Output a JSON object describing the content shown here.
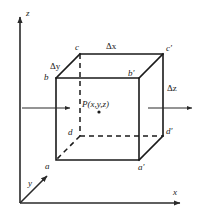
{
  "figure": {
    "background_color": "#ffffff",
    "line_color": "#1a1a1a",
    "axes": [
      {
        "name": "z-axis",
        "label": "z",
        "direction": "up"
      },
      {
        "name": "x-axis",
        "label": "x",
        "direction": "right"
      },
      {
        "name": "y-axis",
        "label": "y",
        "direction": "down-left"
      }
    ],
    "vertices": [
      {
        "name": "vertex-a",
        "label": "a"
      },
      {
        "name": "vertex-b",
        "label": "b"
      },
      {
        "name": "vertex-c",
        "label": "c"
      },
      {
        "name": "vertex-d",
        "label": "d"
      },
      {
        "name": "vertex-a-prime",
        "label": "a′"
      },
      {
        "name": "vertex-b-prime",
        "label": "b′"
      },
      {
        "name": "vertex-c-prime",
        "label": "c′"
      },
      {
        "name": "vertex-d-prime",
        "label": "d′"
      }
    ],
    "dimensions": [
      {
        "name": "delta-x",
        "delta": "Δ",
        "var": "x",
        "label": "Δx",
        "edge": "top-back"
      },
      {
        "name": "delta-y",
        "delta": "Δ",
        "var": "y",
        "label": "Δy",
        "edge": "top-left-oblique"
      },
      {
        "name": "delta-z",
        "delta": "Δ",
        "var": "z",
        "label": "Δz",
        "edge": "right-vertical"
      }
    ],
    "center_point": {
      "name": "point-P",
      "label": "P(x,y,z)",
      "prefix": "P(",
      "vars": "x,y,z",
      "suffix": ")"
    },
    "flux_arrows": [
      {
        "name": "flux-arrow-in",
        "direction": "right",
        "side": "left"
      },
      {
        "name": "flux-arrow-out",
        "direction": "right",
        "side": "right"
      }
    ]
  }
}
